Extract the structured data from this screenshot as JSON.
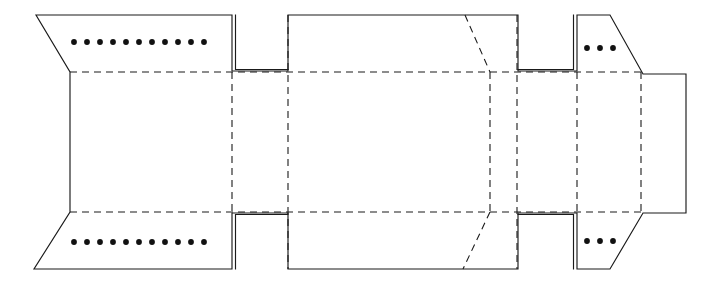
{
  "document": {
    "title": "Carton Dieline Net",
    "subtitle": "Flat unfolded packaging blank",
    "background_color": "#ffffff",
    "line_color": "#1a1a1a",
    "dot_color": "#111111",
    "canvas": {
      "width": 718,
      "height": 283
    }
  },
  "drawing": {
    "type": "packaging-dieline",
    "line_styles": {
      "cut": "solid",
      "fold": "dashed",
      "glue_tab_edge": "double-solid",
      "perforation": "dotted"
    },
    "outline_cut_path": "M 36 15 L 232 15 L 232 71 L 288 71 L 288 15 L 518 15 L 518 71 L 577 71 L 577 15 L 610 15 L 643 74 L 686 74 L 686 213 L 643 213 L 610 269 L 577 269 L 577 213 L 518 213 L 518 269 L 288 269 L 288 213 L 232 213 L 232 269 L 34 269 L 70 212 L 70 72 Z",
    "fold_lines": [
      {
        "name": "top-horizontal-fold",
        "x1": 70,
        "y1": 72,
        "x2": 643,
        "y2": 72
      },
      {
        "name": "bottom-horizontal-fold",
        "x1": 70,
        "y1": 212,
        "x2": 643,
        "y2": 212
      },
      {
        "name": "vertical-fold-1",
        "x1": 288,
        "y1": 15,
        "x2": 288,
        "y2": 269
      },
      {
        "name": "vertical-fold-2",
        "x1": 490,
        "y1": 72,
        "x2": 490,
        "y2": 212
      },
      {
        "name": "vertical-fold-3",
        "x1": 517,
        "y1": 15,
        "x2": 517,
        "y2": 269
      },
      {
        "name": "vertical-fold-4",
        "x1": 577,
        "y1": 72,
        "x2": 577,
        "y2": 212
      },
      {
        "name": "vertical-fold-5",
        "x1": 641,
        "y1": 72,
        "x2": 641,
        "y2": 212
      },
      {
        "name": "vertical-fold-6",
        "x1": 232,
        "y1": 72,
        "x2": 232,
        "y2": 212
      },
      {
        "name": "angled-fold-top",
        "x1": 465,
        "y1": 15,
        "x2": 490,
        "y2": 72
      },
      {
        "name": "angled-fold-bottom",
        "x1": 490,
        "y1": 212,
        "x2": 463,
        "y2": 269
      }
    ],
    "glue_tabs": [
      {
        "name": "tab-top-left",
        "x": 232,
        "y": 15,
        "width": 56,
        "height": 58
      },
      {
        "name": "tab-top-right",
        "x": 518,
        "y": 15,
        "width": 59,
        "height": 58
      },
      {
        "name": "tab-bottom-left",
        "x": 232,
        "y": 211,
        "width": 56,
        "height": 58
      },
      {
        "name": "tab-bottom-right",
        "x": 518,
        "y": 211,
        "width": 59,
        "height": 58
      }
    ],
    "perforation_rows": [
      {
        "name": "perforation-row-top-left",
        "count": 11,
        "y": 42,
        "x_start": 74,
        "x_step": 13,
        "radius": 2.9
      },
      {
        "name": "perforation-row-bottom-left",
        "count": 11,
        "y": 242,
        "x_start": 74,
        "x_step": 13,
        "radius": 2.9
      },
      {
        "name": "perforation-row-top-right",
        "count": 3,
        "y": 48,
        "x_start": 587,
        "x_step": 13,
        "radius": 2.9
      },
      {
        "name": "perforation-row-bottom-right",
        "count": 3,
        "y": 241,
        "x_start": 587,
        "x_step": 13,
        "radius": 2.9
      }
    ]
  }
}
